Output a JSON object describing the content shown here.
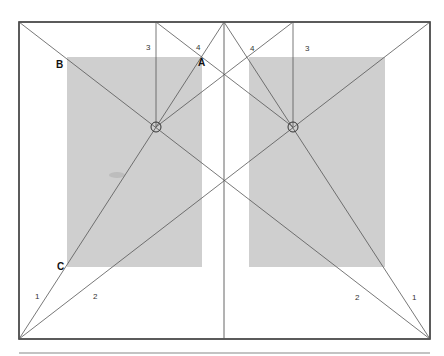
{
  "diagram": {
    "title": "",
    "colors": {
      "background": "#ffffff",
      "frame": "#333333",
      "text_block": "#cfcfcf",
      "construction_line": "#555555",
      "separator": "#888888"
    },
    "frame": {
      "x1": 19,
      "y1": 22,
      "x2": 430,
      "y2": 339
    },
    "spine_x": 224,
    "separator_y": 353,
    "text_blocks": [
      {
        "name": "left",
        "x": 67,
        "y": 57,
        "w": 135,
        "h": 210
      },
      {
        "name": "right",
        "x": 249,
        "y": 57,
        "w": 136,
        "h": 210
      }
    ],
    "circles": [
      {
        "name": "left",
        "cx": 156,
        "cy": 127,
        "r": 5
      },
      {
        "name": "right",
        "cx": 293,
        "cy": 127,
        "r": 5
      }
    ],
    "lines": [
      {
        "name": "spread-diagonal-1",
        "x1": 19,
        "y1": 339,
        "x2": 430,
        "y2": 22
      },
      {
        "name": "spread-diagonal-2",
        "x1": 19,
        "y1": 22,
        "x2": 430,
        "y2": 339
      },
      {
        "name": "left-page-diagonal",
        "x1": 19,
        "y1": 339,
        "x2": 224,
        "y2": 22
      },
      {
        "name": "right-page-diagonal",
        "x1": 430,
        "y1": 339,
        "x2": 224,
        "y2": 22
      },
      {
        "name": "left-vertical-3",
        "x1": 156,
        "y1": 22,
        "x2": 156,
        "y2": 127
      },
      {
        "name": "right-vertical-3",
        "x1": 293,
        "y1": 22,
        "x2": 293,
        "y2": 127
      },
      {
        "name": "left-cross-4",
        "x1": 156,
        "y1": 22,
        "x2": 293,
        "y2": 127
      },
      {
        "name": "right-cross-4",
        "x1": 293,
        "y1": 22,
        "x2": 156,
        "y2": 127
      }
    ],
    "labels": [
      {
        "text": "B",
        "x": 56,
        "y": 68,
        "style": "bold"
      },
      {
        "text": "A",
        "x": 198,
        "y": 66,
        "style": "bold"
      },
      {
        "text": "C",
        "x": 57,
        "y": 270,
        "style": "bold"
      },
      {
        "text": "3",
        "x": 146,
        "y": 50,
        "style": "normal"
      },
      {
        "text": "4",
        "x": 196,
        "y": 50,
        "style": "normal"
      },
      {
        "text": "4",
        "x": 250,
        "y": 51,
        "style": "normal"
      },
      {
        "text": "3",
        "x": 305,
        "y": 51,
        "style": "normal"
      },
      {
        "text": "1",
        "x": 35,
        "y": 299,
        "style": "normal"
      },
      {
        "text": "2",
        "x": 93,
        "y": 299,
        "style": "normal"
      },
      {
        "text": "2",
        "x": 355,
        "y": 300,
        "style": "normal"
      },
      {
        "text": "1",
        "x": 412,
        "y": 300,
        "style": "normal"
      }
    ]
  }
}
